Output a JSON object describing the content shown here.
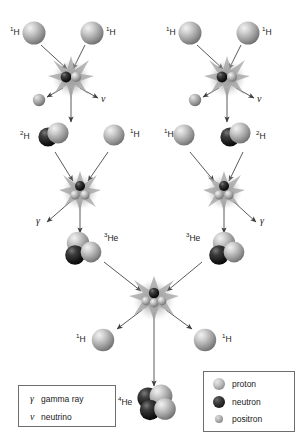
{
  "figure": {
    "background": "#ffffff",
    "width": 308,
    "height": 443
  },
  "colors": {
    "proton": "#c4c4c4",
    "neutron": "#1b1b1b",
    "positron": "#b5b5b5",
    "arrow": "#555555",
    "burst": "#9a9a9a",
    "text": "#1a1a1a",
    "legend_border": "#6e6e6e"
  },
  "nuclei_labels": {
    "hydrogen_1_left_a": "1H",
    "hydrogen_1_left_b": "1H",
    "hydrogen_1_right_a": "1H",
    "hydrogen_1_right_b": "1H",
    "deuterium_left": "2H",
    "hydrogen_1_mid_left": "1H",
    "hydrogen_1_mid_right": "1H",
    "deuterium_right": "2H",
    "helium_3_left": "3He",
    "helium_3_right": "3He",
    "hydrogen_1_out_left": "1H",
    "hydrogen_1_out_right": "1H",
    "helium_4": "4He"
  },
  "emission_labels": {
    "neutrino_left": "ν",
    "neutrino_right": "ν",
    "gamma_left": "γ",
    "gamma_right": "γ"
  },
  "legend_particles": {
    "rows": [
      {
        "symbol": "γ",
        "text": "gamma ray"
      },
      {
        "symbol": "ν",
        "text": "neutrino"
      }
    ]
  },
  "legend_key": {
    "rows": [
      {
        "icon": "proton-sphere-icon",
        "label": "proton"
      },
      {
        "icon": "neutron-sphere-icon",
        "label": "neutron"
      },
      {
        "icon": "positron-sphere-icon",
        "label": "positron"
      }
    ]
  },
  "reaction_steps": [
    {
      "step": 1,
      "equation": "1H + 1H -> 2H + e+ + ν"
    },
    {
      "step": 2,
      "equation": "2H + 1H -> 3He + γ"
    },
    {
      "step": 3,
      "equation": "3He + 3He -> 4He + 1H + 1H"
    }
  ]
}
